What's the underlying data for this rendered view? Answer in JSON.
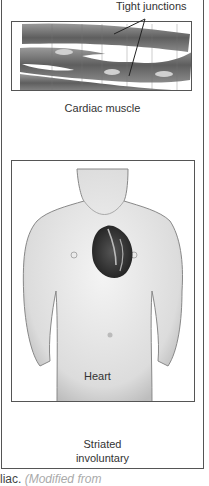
{
  "figure": {
    "muscle_panel": {
      "annotation": "Tight junctions",
      "caption": "Cardiac muscle"
    },
    "heart_panel": {
      "organ_label": "Heart"
    },
    "type_label_line1": "Striated",
    "type_label_line2": "involuntary",
    "footer_caption_prefix": "liac.",
    "footer_caption_italic": "(Modified from"
  },
  "colors": {
    "border": "#555555",
    "muscle_fiber": "#6a6a6a",
    "skin": "#e8e8e8",
    "heart": "#3a3a3a",
    "text": "#333333"
  }
}
